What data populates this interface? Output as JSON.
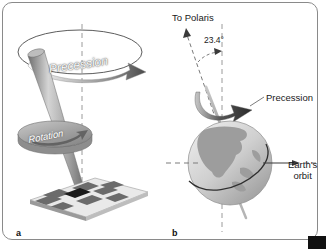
{
  "figure": {
    "background_color": "#ffffff",
    "frame_color": "#8a8a8a",
    "panels": [
      {
        "letter": "a",
        "subject": "spinning-top",
        "labels": [
          {
            "name": "precession",
            "text": "Precession"
          },
          {
            "name": "rotation",
            "text": "Rotation"
          }
        ],
        "elements": [
          "precession-ellipse",
          "precession-arrow",
          "top-shaft",
          "top-disk",
          "rotation-arrow",
          "vertical-dashed-axis",
          "checkerboard-base"
        ]
      },
      {
        "letter": "b",
        "subject": "earth-axial-precession",
        "labels": [
          {
            "name": "to-polaris",
            "text": "To Polaris"
          },
          {
            "name": "tilt-angle",
            "text": "23.4°"
          },
          {
            "name": "precession",
            "text": "Precession"
          },
          {
            "name": "earth-orbit-line1",
            "text": "Earth's"
          },
          {
            "name": "earth-orbit-line2",
            "text": "orbit"
          }
        ],
        "elements": [
          "polaris-dashed-arrow",
          "tilt-angle-arc",
          "vertical-dashed-reference",
          "precession-curved-arrow",
          "earth-globe",
          "north-america-landmass",
          "equator-line",
          "rotation-axis",
          "orbit-dashed-line",
          "orbit-arrow"
        ]
      }
    ],
    "colors": {
      "ink": "#1a1a1a",
      "axis_dash": "#9a9a9a",
      "arrow_dark": "#3a3a3a",
      "ocean": "#cfcfcf",
      "land": "#9d9d9d",
      "checker_dark": "#6b6b6b",
      "checker_light": "#f2f2f2",
      "top_metal": "#a8a8a8"
    }
  }
}
